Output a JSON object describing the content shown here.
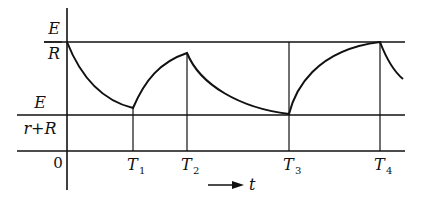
{
  "diagram": {
    "type": "waveform",
    "y_labels": {
      "upper": {
        "numerator": "E",
        "denominator": "R"
      },
      "lower": {
        "numerator": "E",
        "denominator": "r+R"
      },
      "origin": "0"
    },
    "x_labels": [
      {
        "name": "T",
        "sub": "1"
      },
      {
        "name": "T",
        "sub": "2"
      },
      {
        "name": "T",
        "sub": "3"
      },
      {
        "name": "T",
        "sub": "4"
      }
    ],
    "axis_arrow_label": "t",
    "colors": {
      "line": "#111111",
      "background": "#ffffff"
    }
  }
}
